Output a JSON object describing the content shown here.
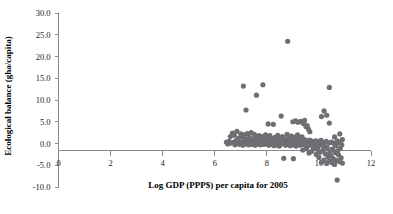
{
  "chart_data": {
    "type": "scatter",
    "title": "",
    "xlabel": "Log GDP (PPP$) per capita for 2005",
    "ylabel": "Ecological balance (gha/capita)",
    "xlim": [
      0,
      12
    ],
    "ylim": [
      -10.0,
      30.0
    ],
    "grid": false,
    "legend": "none",
    "marker": {
      "shape": "circle",
      "color": "#6e6e73",
      "radius_px": 2.6
    },
    "xticks": [
      0,
      2,
      4,
      6,
      8,
      10,
      12
    ],
    "xtick_labels": [
      "0",
      "2",
      "4",
      "6",
      "8",
      "10",
      "12"
    ],
    "yticks": [
      -10.0,
      -5.0,
      0.0,
      5.0,
      10.0,
      15.0,
      20.0,
      25.0,
      30.0
    ],
    "ytick_labels": [
      "-10.0",
      "-5.0",
      "0.0",
      "5.0",
      "10.0",
      "15.0",
      "20.0",
      "25.0",
      "30.0"
    ],
    "zero_line_y": 0.0,
    "points": [
      [
        6.45,
        0.3
      ],
      [
        6.5,
        -0.1
      ],
      [
        6.55,
        0.5
      ],
      [
        6.6,
        1.6
      ],
      [
        6.62,
        0.1
      ],
      [
        6.68,
        2.4
      ],
      [
        6.7,
        0.2
      ],
      [
        6.75,
        1.9
      ],
      [
        6.78,
        -0.3
      ],
      [
        6.8,
        0.6
      ],
      [
        6.85,
        2.8
      ],
      [
        6.88,
        0.0
      ],
      [
        6.9,
        1.2
      ],
      [
        6.95,
        -0.2
      ],
      [
        6.98,
        0.4
      ],
      [
        7.0,
        2.2
      ],
      [
        7.02,
        0.1
      ],
      [
        7.05,
        1.5
      ],
      [
        7.08,
        -0.4
      ],
      [
        7.1,
        0.3
      ],
      [
        7.1,
        13.2
      ],
      [
        7.12,
        2.0
      ],
      [
        7.15,
        0.6
      ],
      [
        7.18,
        -0.1
      ],
      [
        7.2,
        1.0
      ],
      [
        7.2,
        7.7
      ],
      [
        7.22,
        0.2
      ],
      [
        7.25,
        2.3
      ],
      [
        7.28,
        0.5
      ],
      [
        7.3,
        -0.3
      ],
      [
        7.32,
        1.4
      ],
      [
        7.35,
        0.1
      ],
      [
        7.38,
        0.7
      ],
      [
        7.4,
        2.5
      ],
      [
        7.42,
        -0.2
      ],
      [
        7.45,
        0.4
      ],
      [
        7.48,
        1.1
      ],
      [
        7.5,
        0.0
      ],
      [
        7.52,
        2.1
      ],
      [
        7.55,
        -0.4
      ],
      [
        7.58,
        0.8
      ],
      [
        7.6,
        11.1
      ],
      [
        7.6,
        1.3
      ],
      [
        7.62,
        0.2
      ],
      [
        7.65,
        -0.1
      ],
      [
        7.68,
        0.9
      ],
      [
        7.7,
        1.8
      ],
      [
        7.72,
        0.3
      ],
      [
        7.75,
        -0.3
      ],
      [
        7.78,
        0.5
      ],
      [
        7.8,
        1.6
      ],
      [
        7.82,
        0.0
      ],
      [
        7.85,
        13.5
      ],
      [
        7.85,
        0.7
      ],
      [
        7.88,
        -0.2
      ],
      [
        7.9,
        1.2
      ],
      [
        7.92,
        0.4
      ],
      [
        7.95,
        2.0
      ],
      [
        7.98,
        -0.1
      ],
      [
        8.0,
        0.6
      ],
      [
        8.02,
        1.5
      ],
      [
        8.05,
        0.2
      ],
      [
        8.05,
        4.5
      ],
      [
        8.08,
        -0.4
      ],
      [
        8.1,
        0.9
      ],
      [
        8.12,
        1.8
      ],
      [
        8.15,
        0.1
      ],
      [
        8.18,
        -0.2
      ],
      [
        8.2,
        0.5
      ],
      [
        8.22,
        1.1
      ],
      [
        8.25,
        0.3
      ],
      [
        8.25,
        4.4
      ],
      [
        8.28,
        -0.5
      ],
      [
        8.3,
        0.8
      ],
      [
        8.32,
        1.4
      ],
      [
        8.35,
        0.0
      ],
      [
        8.38,
        -0.3
      ],
      [
        8.4,
        0.6
      ],
      [
        8.42,
        1.9
      ],
      [
        8.45,
        0.2
      ],
      [
        8.48,
        -0.6
      ],
      [
        8.5,
        0.4
      ],
      [
        8.52,
        1.2
      ],
      [
        8.55,
        -0.1
      ],
      [
        8.55,
        6.3
      ],
      [
        8.58,
        0.7
      ],
      [
        8.6,
        1.6
      ],
      [
        8.62,
        0.1
      ],
      [
        8.65,
        -3.4
      ],
      [
        8.68,
        0.3
      ],
      [
        8.7,
        1.0
      ],
      [
        8.72,
        -0.4
      ],
      [
        8.75,
        0.5
      ],
      [
        8.78,
        2.1
      ],
      [
        8.8,
        0.0
      ],
      [
        8.8,
        23.5
      ],
      [
        8.82,
        -0.2
      ],
      [
        8.85,
        1.3
      ],
      [
        8.88,
        0.6
      ],
      [
        8.9,
        -0.5
      ],
      [
        8.92,
        0.2
      ],
      [
        8.95,
        1.7
      ],
      [
        8.98,
        -0.3
      ],
      [
        9.0,
        0.8
      ],
      [
        9.0,
        5.0
      ],
      [
        9.02,
        -3.5
      ],
      [
        9.05,
        0.1
      ],
      [
        9.08,
        1.4
      ],
      [
        9.1,
        0.4
      ],
      [
        9.1,
        5.2
      ],
      [
        9.12,
        -0.6
      ],
      [
        9.15,
        0.6
      ],
      [
        9.18,
        2.0
      ],
      [
        9.2,
        -0.2
      ],
      [
        9.2,
        4.9
      ],
      [
        9.22,
        0.3
      ],
      [
        9.25,
        1.1
      ],
      [
        9.28,
        -0.4
      ],
      [
        9.3,
        0.7
      ],
      [
        9.3,
        5.1
      ],
      [
        9.32,
        0.0
      ],
      [
        9.35,
        1.5
      ],
      [
        9.38,
        -1.5
      ],
      [
        9.4,
        0.5
      ],
      [
        9.4,
        4.6
      ],
      [
        9.42,
        -0.3
      ],
      [
        9.45,
        0.9
      ],
      [
        9.45,
        5.3
      ],
      [
        9.48,
        -0.1
      ],
      [
        9.5,
        0.4
      ],
      [
        9.5,
        3.9
      ],
      [
        9.52,
        -1.2
      ],
      [
        9.55,
        0.6
      ],
      [
        9.55,
        4.1
      ],
      [
        9.58,
        -0.5
      ],
      [
        9.6,
        0.2
      ],
      [
        9.6,
        3.3
      ],
      [
        9.62,
        -2.2
      ],
      [
        9.65,
        0.8
      ],
      [
        9.65,
        2.7
      ],
      [
        9.68,
        -0.3
      ],
      [
        9.7,
        0.1
      ],
      [
        9.72,
        -1.8
      ],
      [
        9.75,
        0.5
      ],
      [
        9.78,
        -0.8
      ],
      [
        9.8,
        0.3
      ],
      [
        9.82,
        -1.1
      ],
      [
        9.85,
        -0.2
      ],
      [
        9.88,
        0.6
      ],
      [
        9.9,
        -2.5
      ],
      [
        9.92,
        0.0
      ],
      [
        9.95,
        -1.4
      ],
      [
        9.98,
        -0.6
      ],
      [
        10.0,
        0.4
      ],
      [
        10.0,
        -3.2
      ],
      [
        10.02,
        -0.1
      ],
      [
        10.05,
        -2.0
      ],
      [
        10.08,
        0.7
      ],
      [
        10.1,
        -4.3
      ],
      [
        10.1,
        6.2
      ],
      [
        10.12,
        -0.4
      ],
      [
        10.15,
        -1.6
      ],
      [
        10.18,
        0.2
      ],
      [
        10.2,
        -3.8
      ],
      [
        10.2,
        7.5
      ],
      [
        10.22,
        -0.7
      ],
      [
        10.25,
        -2.4
      ],
      [
        10.28,
        0.5
      ],
      [
        10.3,
        -4.6
      ],
      [
        10.3,
        6.5
      ],
      [
        10.32,
        -1.0
      ],
      [
        10.35,
        -3.0
      ],
      [
        10.38,
        0.1
      ],
      [
        10.4,
        -4.0
      ],
      [
        10.4,
        12.9
      ],
      [
        10.4,
        4.7
      ],
      [
        10.42,
        -1.9
      ],
      [
        10.45,
        -2.8
      ],
      [
        10.48,
        0.3
      ],
      [
        10.5,
        -4.4
      ],
      [
        10.52,
        -1.3
      ],
      [
        10.55,
        -3.5
      ],
      [
        10.58,
        0.0
      ],
      [
        10.6,
        -4.8
      ],
      [
        10.6,
        1.5
      ],
      [
        10.62,
        -2.1
      ],
      [
        10.65,
        -0.5
      ],
      [
        10.68,
        -3.9
      ],
      [
        10.7,
        0.6
      ],
      [
        10.7,
        -8.4
      ],
      [
        10.72,
        -1.7
      ],
      [
        10.75,
        -2.6
      ],
      [
        10.78,
        0.2
      ],
      [
        10.8,
        -4.2
      ],
      [
        10.8,
        2.2
      ],
      [
        10.82,
        -1.1
      ],
      [
        10.85,
        -3.3
      ],
      [
        10.88,
        -0.3
      ],
      [
        10.9,
        -4.5
      ],
      [
        10.9,
        0.9
      ]
    ]
  }
}
